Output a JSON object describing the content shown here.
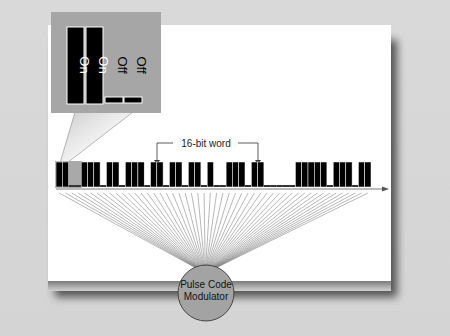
{
  "diagram": {
    "word_label": "16-bit word",
    "modulator_label_line1": "Pulse Code",
    "modulator_label_line2": "Modulator",
    "inset": {
      "on_label": "On",
      "off_label": "Off",
      "bits": [
        1,
        1,
        0,
        0
      ]
    },
    "bit_stream": [
      1,
      1,
      0,
      0,
      1,
      1,
      1,
      0,
      1,
      1,
      0,
      1,
      1,
      1,
      0,
      1,
      1,
      0,
      1,
      1,
      0,
      1,
      1,
      0,
      1,
      0,
      0,
      1,
      1,
      1,
      0,
      1,
      1,
      0,
      0,
      0,
      0,
      0,
      1,
      1,
      1,
      1,
      1,
      0,
      1,
      1,
      1,
      0,
      1,
      1
    ],
    "colors": {
      "background": "#d7d7d7",
      "panel": "#ffffff",
      "bar_on": "#000000",
      "bit_off_highlight": "#a9a9a9",
      "inset_frame": "#a6a6a6",
      "modulator_fill": "#a3a3a3",
      "fan_lines": "#6e6e6e"
    }
  }
}
